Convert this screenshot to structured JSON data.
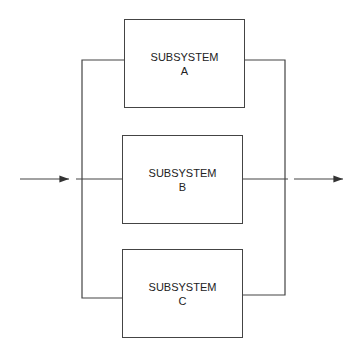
{
  "diagram": {
    "type": "parallel-system-block-diagram",
    "blocks": [
      {
        "id": "A",
        "title": "SUBSYSTEM",
        "label": "A"
      },
      {
        "id": "B",
        "title": "SUBSYSTEM",
        "label": "B"
      },
      {
        "id": "C",
        "title": "SUBSYSTEM",
        "label": "C"
      }
    ],
    "input": "input-arrow",
    "output": "output-arrow",
    "colors": {
      "line": "#444444",
      "background": "#ffffff"
    }
  }
}
